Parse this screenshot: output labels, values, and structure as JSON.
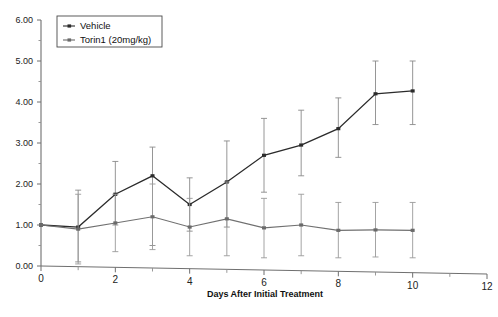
{
  "figure": {
    "background_color": "#ffffff",
    "top_artifact_text": "",
    "bottom_left_artifact_text": ""
  },
  "legend": {
    "position": "top-left-inside",
    "entries": [
      {
        "label": "Vehicle",
        "color": "#2b2b2b",
        "marker": "line-marker-icon"
      },
      {
        "label": "Torin1 (20mg/kg)",
        "color": "#6a6a6a",
        "marker": "line-marker-icon"
      }
    ]
  },
  "chart_data": {
    "type": "line",
    "title": "",
    "xlabel": "Days After Initial Treatment",
    "ylabel": "",
    "xlim": [
      0,
      12
    ],
    "ylim": [
      0,
      6
    ],
    "xticks": [
      0,
      2,
      4,
      6,
      8,
      10,
      12
    ],
    "xticklabels": [
      "0",
      "2",
      "4",
      "6",
      "8",
      "10",
      "12"
    ],
    "x_minor_tick_step": 1,
    "yticks": [
      0,
      1,
      2,
      3,
      4,
      5,
      6
    ],
    "yticklabels": [
      "0.00",
      "1.00",
      "2.00",
      "3.00",
      "4.00",
      "5.00",
      "6.00"
    ],
    "y_minor_tick_step": 0.5,
    "grid": false,
    "x": [
      0,
      1,
      2,
      3,
      4,
      5,
      6,
      7,
      8,
      9,
      10
    ],
    "series": [
      {
        "name": "Vehicle",
        "color": "#2b2b2b",
        "values": [
          1.0,
          0.95,
          1.75,
          2.2,
          1.5,
          2.05,
          2.7,
          2.95,
          3.35,
          4.2,
          4.27
        ],
        "err_low": [
          1.0,
          0.1,
          1.0,
          0.5,
          0.85,
          0.95,
          1.8,
          2.2,
          2.65,
          3.45,
          3.45
        ],
        "err_high": [
          1.0,
          1.85,
          2.55,
          2.9,
          2.15,
          3.05,
          3.6,
          3.8,
          4.1,
          5.0,
          5.0
        ]
      },
      {
        "name": "Torin1 (20mg/kg)",
        "color": "#6a6a6a",
        "values": [
          1.0,
          0.9,
          1.05,
          1.2,
          0.95,
          1.15,
          0.93,
          1.0,
          0.87,
          0.88,
          0.87
        ],
        "err_low": [
          1.0,
          0.05,
          0.35,
          0.4,
          0.25,
          0.25,
          0.2,
          0.25,
          0.2,
          0.22,
          0.2
        ],
        "err_high": [
          1.0,
          1.75,
          1.75,
          2.0,
          1.65,
          2.05,
          1.65,
          1.75,
          1.55,
          1.55,
          1.55
        ]
      }
    ]
  }
}
